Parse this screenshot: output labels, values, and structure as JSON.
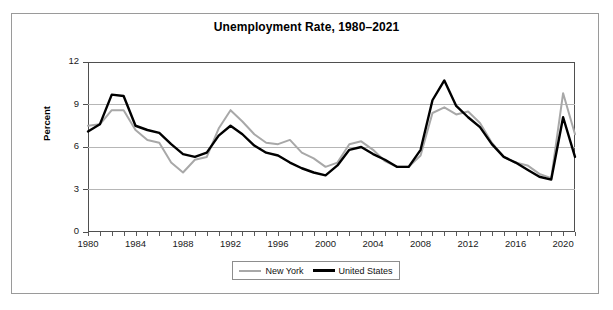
{
  "figure": {
    "title": "Unemployment Rate, 1980–2021",
    "ylabel": "Percent"
  },
  "legend": {
    "items": [
      {
        "label": "New York",
        "color": "#a8a8a8"
      },
      {
        "label": "United States",
        "color": "#000000"
      }
    ]
  },
  "axis": {
    "y_ticks": [
      "0",
      "3",
      "6",
      "9",
      "12"
    ],
    "x_ticks": [
      "1980",
      "1984",
      "1988",
      "1992",
      "1996",
      "2000",
      "2004",
      "2008",
      "2012",
      "2016",
      "2020"
    ]
  },
  "chart_data": {
    "type": "line",
    "title": "Unemployment Rate, 1980–2021",
    "xlabel": "",
    "ylabel": "Percent",
    "xlim": [
      1980,
      2021
    ],
    "ylim": [
      0,
      12
    ],
    "ytick_interval": 3,
    "xtick_interval": 4,
    "grid": "horizontal",
    "legend_position": "bottom-center",
    "x": [
      1980,
      1981,
      1982,
      1983,
      1984,
      1985,
      1986,
      1987,
      1988,
      1989,
      1990,
      1991,
      1992,
      1993,
      1994,
      1995,
      1996,
      1997,
      1998,
      1999,
      2000,
      2001,
      2002,
      2003,
      2004,
      2005,
      2006,
      2007,
      2008,
      2009,
      2010,
      2011,
      2012,
      2013,
      2014,
      2015,
      2016,
      2017,
      2018,
      2019,
      2020,
      2021
    ],
    "series": [
      {
        "name": "New York",
        "color": "#a8a8a8",
        "values": [
          7.5,
          7.6,
          8.6,
          8.6,
          7.2,
          6.5,
          6.3,
          4.9,
          4.2,
          5.1,
          5.3,
          7.3,
          8.6,
          7.8,
          6.9,
          6.3,
          6.2,
          6.5,
          5.6,
          5.2,
          4.6,
          4.9,
          6.2,
          6.4,
          5.8,
          5.0,
          4.6,
          4.6,
          5.4,
          8.4,
          8.8,
          8.3,
          8.5,
          7.7,
          6.3,
          5.3,
          4.9,
          4.7,
          4.1,
          3.8,
          9.8,
          6.9
        ]
      },
      {
        "name": "United States",
        "color": "#000000",
        "values": [
          7.1,
          7.6,
          9.7,
          9.6,
          7.5,
          7.2,
          7.0,
          6.2,
          5.5,
          5.3,
          5.6,
          6.8,
          7.5,
          6.9,
          6.1,
          5.6,
          5.4,
          4.9,
          4.5,
          4.2,
          4.0,
          4.7,
          5.8,
          6.0,
          5.5,
          5.1,
          4.6,
          4.6,
          5.8,
          9.3,
          10.7,
          8.9,
          8.1,
          7.4,
          6.2,
          5.3,
          4.9,
          4.4,
          3.9,
          3.7,
          8.1,
          5.3
        ]
      }
    ]
  }
}
